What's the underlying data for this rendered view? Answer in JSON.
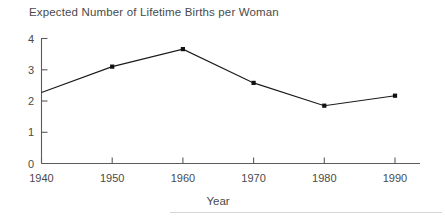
{
  "figure": {
    "title": "Expected Number of Lifetime Births per Woman",
    "footer_rule_visible": true
  },
  "chart_data": {
    "type": "line",
    "title": "Expected Number of Lifetime Births per Woman",
    "xlabel": "Year",
    "ylabel": "",
    "x": [
      1940,
      1950,
      1960,
      1970,
      1980,
      1990
    ],
    "values": [
      2.27,
      3.1,
      3.66,
      2.58,
      1.85,
      2.17
    ],
    "xticklabels": [
      "1940",
      "1950",
      "1960",
      "1970",
      "1980",
      "1990"
    ],
    "yticklabels": [
      "0",
      "1",
      "2",
      "3",
      "4"
    ],
    "yticks": [
      0,
      1,
      2,
      3,
      4
    ],
    "xlim": [
      1940,
      1990
    ],
    "ylim": [
      0,
      4
    ],
    "grid": false,
    "legend": false,
    "marker": "square",
    "line_color": "#1a1a1a",
    "marker_color": "#111111",
    "axis_color": "#5b5b5b",
    "background_color": "#ffffff"
  },
  "axes": {
    "y_tick_labels": [
      {
        "value": "4"
      },
      {
        "value": "3"
      },
      {
        "value": "2"
      },
      {
        "value": "1"
      },
      {
        "value": "0"
      }
    ],
    "x_tick_labels": [
      {
        "value": "1940"
      },
      {
        "value": "1950"
      },
      {
        "value": "1960"
      },
      {
        "value": "1970"
      },
      {
        "value": "1980"
      },
      {
        "value": "1990"
      }
    ],
    "x_axis_title": "Year"
  }
}
